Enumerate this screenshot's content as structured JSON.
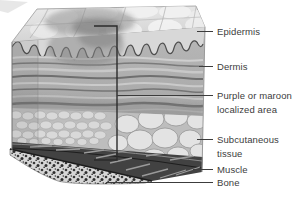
{
  "figure": {
    "colors": {
      "background": "#ffffff",
      "leader_line": "#3c3c3c",
      "label_text": "#3c3c3c"
    },
    "labels": [
      {
        "id": "epidermis",
        "text": "Epidermis"
      },
      {
        "id": "dermis",
        "text": "Dermis"
      },
      {
        "id": "localized-area",
        "text": "Purple or maroon localized area"
      },
      {
        "id": "subcutaneous",
        "text": "Subcutaneous tissue"
      },
      {
        "id": "muscle",
        "text": "Muscle"
      },
      {
        "id": "bone",
        "text": "Bone"
      }
    ]
  }
}
